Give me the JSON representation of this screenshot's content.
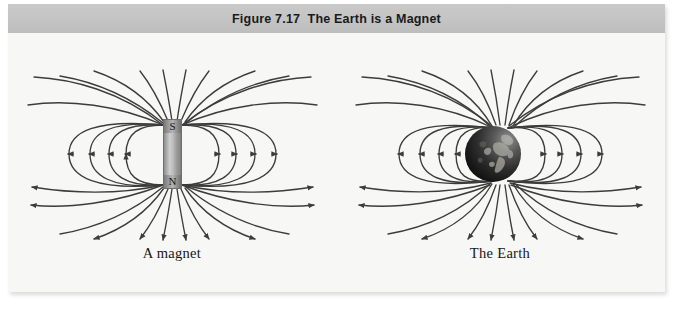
{
  "figure": {
    "title": "Figure 7.17  The Earth is a Magnet",
    "background_color": "#f7f7f5",
    "title_band_color": "#c4c4c4",
    "line_color": "#3c3c3c"
  },
  "panels": [
    {
      "id": "magnet-panel",
      "caption": "A magnet",
      "object": "bar-magnet",
      "poles": {
        "top": "S",
        "bottom": "N"
      }
    },
    {
      "id": "earth-panel",
      "caption": "The Earth",
      "object": "earth-globe",
      "poles": {
        "top": "",
        "bottom": ""
      }
    }
  ],
  "field": {
    "description": "magnetic dipole field lines",
    "loop_count_per_side": 4,
    "arrow_direction_left": "left",
    "arrow_direction_right": "right",
    "arrow_direction_below": "down"
  }
}
